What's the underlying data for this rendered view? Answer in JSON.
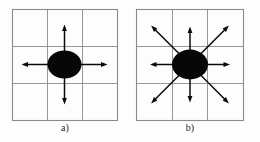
{
  "figure": {
    "background_color": "#fdfdfd",
    "grid_line_color": "#8a8a8a",
    "blob_color": "#070707",
    "arrow_color": "#0b0b0b",
    "caption_color": "#1d1d1d",
    "panels": [
      {
        "id": "a",
        "caption": "a)",
        "grid": {
          "x": 12,
          "y": 9,
          "width": 105,
          "height": 111,
          "rows": 3,
          "cols": 3
        },
        "blob": {
          "cx": 64.5,
          "cy": 64.5,
          "rx": 17,
          "ry": 14
        },
        "arrow_count": 4,
        "arrows": [
          {
            "name": "arrow-up",
            "angle_deg": 270,
            "length": 40
          },
          {
            "name": "arrow-down",
            "angle_deg": 90,
            "length": 40
          },
          {
            "name": "arrow-left",
            "angle_deg": 180,
            "length": 43
          },
          {
            "name": "arrow-right",
            "angle_deg": 0,
            "length": 43
          }
        ]
      },
      {
        "id": "b",
        "caption": "b)",
        "grid": {
          "x": 136,
          "y": 9,
          "width": 107,
          "height": 111,
          "rows": 3,
          "cols": 3
        },
        "blob": {
          "cx": 190,
          "cy": 64.5,
          "rx": 18,
          "ry": 15
        },
        "arrow_count": 8,
        "arrows": [
          {
            "name": "arrow-up",
            "angle_deg": 270,
            "length": 38
          },
          {
            "name": "arrow-down",
            "angle_deg": 90,
            "length": 38
          },
          {
            "name": "arrow-left",
            "angle_deg": 180,
            "length": 40
          },
          {
            "name": "arrow-right",
            "angle_deg": 0,
            "length": 40
          },
          {
            "name": "arrow-up-left",
            "angle_deg": 225,
            "length": 55
          },
          {
            "name": "arrow-up-right",
            "angle_deg": 315,
            "length": 55
          },
          {
            "name": "arrow-down-left",
            "angle_deg": 135,
            "length": 55
          },
          {
            "name": "arrow-down-right",
            "angle_deg": 45,
            "length": 55
          }
        ]
      }
    ]
  }
}
